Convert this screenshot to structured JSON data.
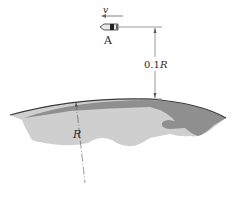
{
  "diagram": {
    "velocity_label": "v",
    "satellite_label": "A",
    "altitude_label_prefix": "0.1",
    "altitude_label_var": "R",
    "radius_label": "R",
    "colors": {
      "earth_light": "#cfcfcf",
      "earth_dark": "#8f8f8f",
      "earth_outline": "#3a3a3a",
      "line": "#4a4a4a",
      "text": "#2a2a2a"
    }
  }
}
